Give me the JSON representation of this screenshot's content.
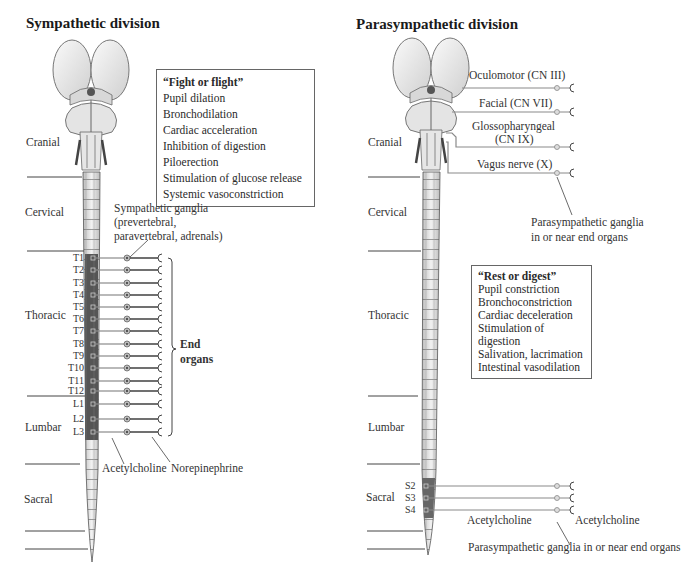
{
  "sympathetic": {
    "title": "Sympathetic division",
    "regions": [
      "Cranial",
      "Cervical",
      "Thoracic",
      "Lumbar",
      "Sacral"
    ],
    "effects_box": {
      "heading": "“Fight or flight”",
      "items": [
        "Pupil dilation",
        "Bronchodilation",
        "Cardiac acceleration",
        "Inhibition of digestion",
        "Piloerection",
        "Stimulation of glucose release",
        "Systemic vasoconstriction"
      ]
    },
    "ganglia_label": [
      "Sympathetic ganglia",
      "(prevertebral,",
      "paravertebral, adrenals)"
    ],
    "segments": [
      "T1",
      "T2",
      "T3",
      "T4",
      "T5",
      "T6",
      "T7",
      "T8",
      "T9",
      "T10",
      "T11",
      "T12",
      "L1",
      "L2",
      "L3"
    ],
    "end_organs_label": [
      "End",
      "organs"
    ],
    "preganglionic_nt": "Acetylcholine",
    "postganglionic_nt": "Norepinephrine"
  },
  "parasympathetic": {
    "title": "Parasympathetic division",
    "regions": [
      "Cranial",
      "Cervical",
      "Thoracic",
      "Lumbar",
      "Sacral"
    ],
    "cranial_nerves": [
      "Oculomotor (CN III)",
      "Facial (CN VII)",
      "Glossopharyngeal",
      "(CN IX)",
      "Vagus nerve (X)"
    ],
    "ganglia_label_top": [
      "Parasympathetic ganglia",
      "in or near end organs"
    ],
    "effects_box": {
      "heading": "“Rest or digest”",
      "items": [
        "Pupil constriction",
        "Bronchoconstriction",
        "Cardiac deceleration",
        "Stimulation of digestion",
        "Salivation, lacrimation",
        "Intestinal vasodilation"
      ]
    },
    "segments": [
      "S2",
      "S3",
      "S4"
    ],
    "preganglionic_nt": "Acetylcholine",
    "postganglionic_nt": "Acetylcholine",
    "ganglia_label_bottom": "Parasympathetic ganglia in or near end organs"
  }
}
